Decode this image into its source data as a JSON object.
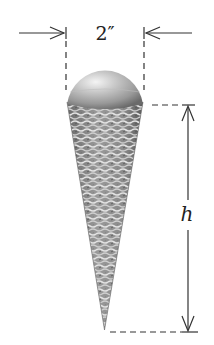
{
  "diagram": {
    "width_label": "2″",
    "height_label": "h",
    "colors": {
      "line": "#333333",
      "sphere_light": "#eeeeee",
      "sphere_mid": "#a8a8a8",
      "sphere_dark": "#6e6e6e",
      "cone_base": "#8a8a8a",
      "cone_weave": "#d8d8d8",
      "cone_shadow": "#5e5e5e"
    }
  }
}
